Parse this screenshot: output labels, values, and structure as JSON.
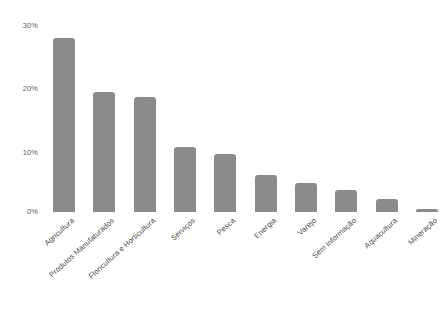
{
  "chart_data": {
    "type": "bar",
    "title": "",
    "subtitle": "",
    "xlabel": "",
    "ylabel": "",
    "categories": [
      "Agricultura",
      "Produtos Manufaturados",
      "Floricultura e Horticultura",
      "Serviços",
      "Pesca",
      "Energia",
      "Varejo",
      "Sem informação",
      "Aquacultura",
      "Mineração"
    ],
    "values": [
      27.2,
      18.8,
      18.0,
      10.2,
      9.0,
      5.8,
      4.5,
      3.5,
      2.0,
      0.5
    ],
    "value_unit": "%",
    "ylim": [
      0,
      30
    ],
    "yticks": [
      0,
      10,
      20,
      30
    ],
    "ytick_labels": [
      "0%",
      "10%",
      "20%",
      "30%"
    ],
    "grid": false,
    "legend": null,
    "legend_position": "none",
    "bar_color": "#8b8b8b",
    "background_color": "#ffffff",
    "tick_label_color": "#5d5d5d",
    "category_label_color": "#4a4a4a",
    "category_label_rotation_deg": -42
  }
}
